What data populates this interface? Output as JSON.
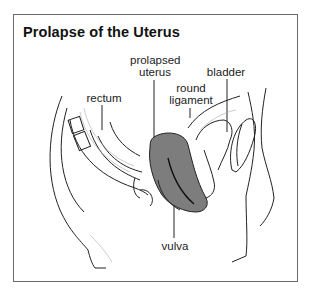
{
  "title": "Prolapse of the Uterus",
  "labels": {
    "prolapsed_uterus_line1": "prolapsed",
    "prolapsed_uterus_line2": "uterus",
    "bladder": "bladder",
    "round_ligament_line1": "round",
    "round_ligament_line2": "ligament",
    "rectum": "rectum",
    "vulva": "vulva"
  },
  "colors": {
    "frame": "#6b6b6b",
    "uterus_fill": "#7d7d7d",
    "line": "#222222"
  }
}
